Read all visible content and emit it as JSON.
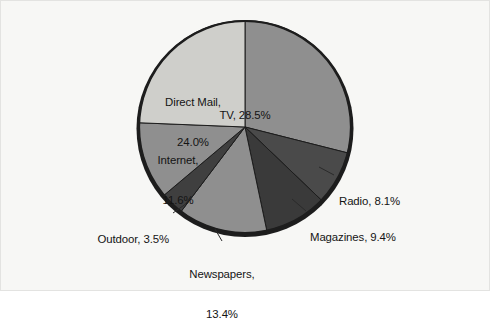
{
  "figure": {
    "background_color": "#f7f7f5",
    "border_color": "#e3e3e1"
  },
  "chart_data": {
    "type": "pie",
    "title": "",
    "subtitle": "",
    "xlabel": "",
    "ylabel": "",
    "legend_position": "none",
    "grid": false,
    "label_format": "{name}, {value}%",
    "start_angle_deg": 0,
    "direction": "clockwise",
    "categories": [
      "TV",
      "Radio",
      "Magazines",
      "Newspapers",
      "Outdoor",
      "Internet",
      "Direct Mail"
    ],
    "values": [
      28.5,
      8.1,
      9.4,
      13.4,
      3.5,
      11.6,
      24.0
    ],
    "total": 98.5,
    "colors": [
      "#8f8f8f",
      "#4a4a4a",
      "#3a3a3a",
      "#8f8f8f",
      "#3f3f3f",
      "#8f8f8f",
      "#cfcfcb"
    ],
    "slice_edge_color": "#1d1d1d",
    "slices": [
      {
        "name": "TV",
        "value": 28.5,
        "label": "TV, 28.5%",
        "label_lines": [
          "TV, 28.5%"
        ],
        "color": "#8f8f8f",
        "label_placement": "inside",
        "leader_line": false
      },
      {
        "name": "Radio",
        "value": 8.1,
        "label": "Radio, 8.1%",
        "label_lines": [
          "Radio, 8.1%"
        ],
        "color": "#4a4a4a",
        "label_placement": "outside",
        "leader_line": true
      },
      {
        "name": "Magazines",
        "value": 9.4,
        "label": "Magazines, 9.4%",
        "label_lines": [
          "Magazines, 9.4%"
        ],
        "color": "#3a3a3a",
        "label_placement": "outside",
        "leader_line": true
      },
      {
        "name": "Newspapers",
        "value": 13.4,
        "label": "Newspapers, 13.4%",
        "label_lines": [
          "Newspapers,",
          "13.4%"
        ],
        "color": "#8f8f8f",
        "label_placement": "outside",
        "leader_line": true
      },
      {
        "name": "Outdoor",
        "value": 3.5,
        "label": "Outdoor, 3.5%",
        "label_lines": [
          "Outdoor, 3.5%"
        ],
        "color": "#3f3f3f",
        "label_placement": "outside",
        "leader_line": true
      },
      {
        "name": "Internet",
        "value": 11.6,
        "label": "Internet, 11.6%",
        "label_lines": [
          "Internet,",
          "11.6%"
        ],
        "color": "#8f8f8f",
        "label_placement": "inside",
        "leader_line": false
      },
      {
        "name": "Direct Mail",
        "value": 24.0,
        "label": "Direct Mail, 24.0%",
        "label_lines": [
          "Direct Mail,",
          "24.0%"
        ],
        "color": "#cfcfcb",
        "label_placement": "inside",
        "leader_line": false
      }
    ]
  },
  "labels": {
    "tv": "TV, 28.5%",
    "direct_mail_line1": "Direct Mail,",
    "direct_mail_line2": "24.0%",
    "internet_line1": "Internet,",
    "internet_line2": "11.6%",
    "radio": "Radio, 8.1%",
    "magazines": "Magazines, 9.4%",
    "newspapers_line1": "Newspapers,",
    "newspapers_line2": "13.4%",
    "outdoor": "Outdoor, 3.5%"
  }
}
